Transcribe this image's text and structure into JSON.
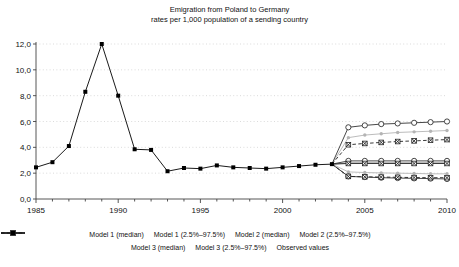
{
  "chart_data": {
    "type": "line",
    "title": "Emigration from Poland to Germany",
    "subtitle": "rates per 1,000 population of a sending country",
    "xlabel": "",
    "ylabel": "",
    "xlim": [
      1985,
      2010
    ],
    "ylim": [
      0.0,
      12.0
    ],
    "ytick_labels": [
      "0,0",
      "2,0",
      "4,0",
      "6,0",
      "8,0",
      "10,0",
      "12,0"
    ],
    "ytick_values": [
      0,
      2,
      4,
      6,
      8,
      10,
      12
    ],
    "xtick_labels": [
      "1985",
      "1990",
      "1995",
      "2000",
      "2005",
      "2010"
    ],
    "xtick_values": [
      1985,
      1990,
      1995,
      2000,
      2005,
      2010
    ],
    "grid": "horizontal-dotted",
    "legend_position": "bottom",
    "series": [
      {
        "name": "Model 1 (median)",
        "marker": "open-circle",
        "line": "solid",
        "color": "#333333",
        "x": [
          2003,
          2004,
          2005,
          2006,
          2007,
          2008,
          2009,
          2010
        ],
        "values": [
          2.7,
          2.95,
          2.95,
          2.95,
          2.95,
          2.95,
          2.95,
          2.95
        ]
      },
      {
        "name": "Model 1 (2.5%–97.5%)",
        "marker": "open-circle",
        "line": "solid",
        "color": "#333333",
        "x": [
          2003,
          2004,
          2005,
          2006,
          2007,
          2008,
          2009,
          2010
        ],
        "upper": [
          2.7,
          5.55,
          5.7,
          5.8,
          5.85,
          5.9,
          5.95,
          6.0
        ],
        "lower": [
          2.7,
          1.75,
          1.7,
          1.65,
          1.62,
          1.6,
          1.58,
          1.55
        ]
      },
      {
        "name": "Model 2 (median)",
        "marker": "small-dot",
        "line": "solid",
        "color": "#9a9a9a",
        "x": [
          2003,
          2004,
          2005,
          2006,
          2007,
          2008,
          2009,
          2010
        ],
        "values": [
          2.7,
          2.8,
          2.8,
          2.8,
          2.8,
          2.8,
          2.8,
          2.8
        ]
      },
      {
        "name": "Model 2 (2.5%–97.5%)",
        "marker": "small-dot",
        "line": "solid",
        "color": "#b4b4b4",
        "x": [
          2003,
          2004,
          2005,
          2006,
          2007,
          2008,
          2009,
          2010
        ],
        "upper": [
          2.7,
          4.75,
          4.95,
          5.05,
          5.15,
          5.2,
          5.25,
          5.3
        ],
        "lower": [
          2.7,
          2.1,
          2.05,
          2.02,
          2.0,
          1.98,
          1.95,
          1.95
        ]
      },
      {
        "name": "Model 3 (median)",
        "marker": "x-box",
        "line": "solid",
        "color": "#222222",
        "x": [
          2003,
          2004,
          2005,
          2006,
          2007,
          2008,
          2009,
          2010
        ],
        "values": [
          2.7,
          2.75,
          2.75,
          2.75,
          2.75,
          2.75,
          2.75,
          2.75
        ]
      },
      {
        "name": "Model 3 (2.5%–97.5%)",
        "marker": "x-box",
        "line": "dashed",
        "color": "#222222",
        "x": [
          2003,
          2004,
          2005,
          2006,
          2007,
          2008,
          2009,
          2010
        ],
        "upper": [
          2.7,
          4.2,
          4.3,
          4.38,
          4.45,
          4.5,
          4.55,
          4.6
        ],
        "lower": [
          2.7,
          1.75,
          1.72,
          1.7,
          1.68,
          1.66,
          1.65,
          1.65
        ]
      },
      {
        "name": "Observed values",
        "marker": "filled-square",
        "line": "solid",
        "color": "#000000",
        "x": [
          1985,
          1986,
          1987,
          1988,
          1989,
          1990,
          1991,
          1992,
          1993,
          1994,
          1995,
          1996,
          1997,
          1998,
          1999,
          2000,
          2001,
          2002,
          2003
        ],
        "values": [
          2.45,
          2.85,
          4.1,
          8.3,
          12.0,
          8.0,
          3.85,
          3.8,
          2.15,
          2.4,
          2.35,
          2.6,
          2.45,
          2.4,
          2.35,
          2.45,
          2.55,
          2.65,
          2.7
        ]
      }
    ]
  },
  "legend": {
    "rows": [
      [
        {
          "label": "Model 1 (median)",
          "marker": "open-circle",
          "line": "solid",
          "color": "#333333"
        },
        {
          "label": "Model 1 (2.5%–97.5%)",
          "marker": "open-circle",
          "line": "solid",
          "color": "#333333"
        },
        {
          "label": "Model 2 (median)",
          "marker": "small-dot",
          "line": "solid",
          "color": "#9a9a9a"
        },
        {
          "label": "Model 2 (2.5%–97.5%)",
          "marker": "small-dot",
          "line": "none",
          "color": "#b4b4b4"
        }
      ],
      [
        {
          "label": "Model 3 (median)",
          "marker": "x-box",
          "line": "solid",
          "color": "#222222"
        },
        {
          "label": "Model 3 (2.5%–97.5%)",
          "marker": "x-box",
          "line": "dashed",
          "color": "#222222"
        },
        {
          "label": "Observed values",
          "marker": "filled-square",
          "line": "solid",
          "color": "#000000"
        }
      ]
    ]
  }
}
